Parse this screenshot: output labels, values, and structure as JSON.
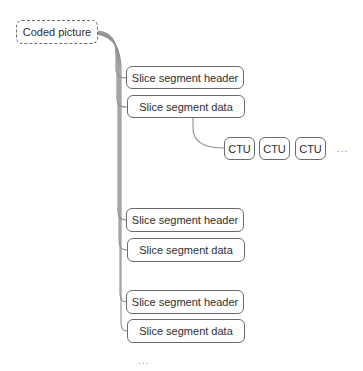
{
  "diagram": {
    "type": "tree",
    "line_color": "#8a8a8a",
    "border_color": "#6b6b6b",
    "text_color": "#2e2e2e",
    "root": {
      "label": "Coded picture",
      "style": "dashed"
    },
    "slice_groups": [
      {
        "header": {
          "label": "Slice segment header"
        },
        "data": {
          "label": "Slice segment data"
        },
        "ctus": [
          {
            "label": "CTU"
          },
          {
            "label": "CTU"
          },
          {
            "label": "CTU"
          }
        ],
        "ctu_more": "..."
      },
      {
        "header": {
          "label": "Slice segment header"
        },
        "data": {
          "label": "Slice segment data"
        }
      },
      {
        "header": {
          "label": "Slice segment header"
        },
        "data": {
          "label": "Slice segment data"
        }
      }
    ],
    "slices_more": "..."
  }
}
